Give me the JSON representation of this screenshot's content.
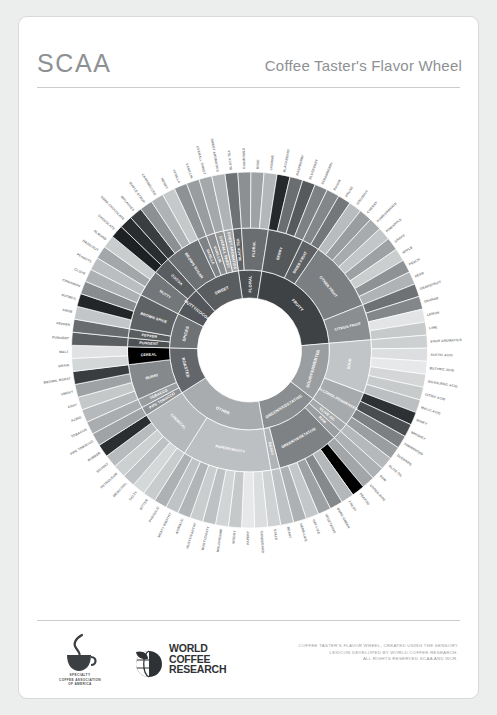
{
  "header": {
    "brand": "SCAA",
    "title": "Coffee Taster's Flavor Wheel"
  },
  "footer": {
    "scaa_logo_text": "SPECIALTY\nCOFFEE ASSOCIATION\nOF AMERICA",
    "wcr_logo_line1": "WORLD",
    "wcr_logo_line2": "COFFEE",
    "wcr_logo_line3": "RESEARCH",
    "credit_line1": "COFFEE TASTER'S FLAVOR WHEEL, CREATED USING THE SENSORY",
    "credit_line2": "LEXICON DEVELOPED BY WORLD COFFEE RESEARCH.",
    "credit_line3": "ALL RIGHTS RESERVED SCAA AND WCR."
  },
  "chart_data": {
    "type": "pie",
    "title": "Coffee Taster's Flavor Wheel",
    "subtitle": "",
    "xlabel": "",
    "ylabel": "",
    "legend_position": "none",
    "grid": false,
    "note": "Three-level sunburst. Angles are proportional to leaf counts; start angle measured clockwise from 12 o'clock.",
    "start_angle_deg": -8,
    "rings": [
      {
        "name": "inner",
        "r_inner": 52,
        "r_outer": 80
      },
      {
        "name": "middle",
        "r_inner": 80,
        "r_outer": 122
      },
      {
        "name": "outer",
        "r_inner": 122,
        "r_outer": 178
      }
    ],
    "categories": [
      {
        "label": "FLORAL",
        "color": "#4d5053",
        "text_color": "#ffffff",
        "groups": [
          {
            "label": "BLACK TEA",
            "color": "#5e6265",
            "text_color": "#ffffff",
            "leaves": [
              {
                "label": "BLACK TEA",
                "color": "#6e7275",
                "text_color": "#ffffff"
              }
            ]
          },
          {
            "label": "FLORAL",
            "color": "#6a6e71",
            "text_color": "#ffffff",
            "leaves": [
              {
                "label": "CHAMOMILE",
                "color": "#8d9093",
                "text_color": "#4a4d4f"
              },
              {
                "label": "ROSE",
                "color": "#9fa2a5",
                "text_color": "#4a4d4f"
              },
              {
                "label": "JASMINE",
                "color": "#b4b7b9",
                "text_color": "#4a4d4f"
              }
            ]
          }
        ]
      },
      {
        "label": "FRUITY",
        "color": "#3f4245",
        "text_color": "#ffffff",
        "groups": [
          {
            "label": "BERRY",
            "color": "#55585b",
            "text_color": "#ffffff",
            "leaves": [
              {
                "label": "BLACKBERRY",
                "color": "#26292b",
                "text_color": "#ffffff"
              },
              {
                "label": "RASPBERRY",
                "color": "#6b6e71",
                "text_color": "#ffffff"
              },
              {
                "label": "BLUEBERRY",
                "color": "#565a5d",
                "text_color": "#ffffff"
              },
              {
                "label": "STRAWBERRY",
                "color": "#7e8184",
                "text_color": "#ffffff"
              }
            ]
          },
          {
            "label": "DRIED FRUIT",
            "color": "#5e6164",
            "text_color": "#ffffff",
            "leaves": [
              {
                "label": "RAISIN",
                "color": "#84878a",
                "text_color": "#ffffff"
              },
              {
                "label": "PRUNE",
                "color": "#74777a",
                "text_color": "#ffffff"
              }
            ]
          },
          {
            "label": "OTHER FRUIT",
            "color": "#7c7f82",
            "text_color": "#ffffff",
            "leaves": [
              {
                "label": "COCONUT",
                "color": "#b9bcbe",
                "text_color": "#4a4d4f"
              },
              {
                "label": "CHERRY",
                "color": "#9a9da0",
                "text_color": "#ffffff"
              },
              {
                "label": "POMEGRANATE",
                "color": "#a8abad",
                "text_color": "#4a4d4f"
              },
              {
                "label": "PINEAPPLE",
                "color": "#c3c6c8",
                "text_color": "#4a4d4f"
              },
              {
                "label": "GRAPE",
                "color": "#9ea1a4",
                "text_color": "#4a4d4f"
              },
              {
                "label": "APPLE",
                "color": "#cbcecf",
                "text_color": "#4a4d4f"
              },
              {
                "label": "PEACH",
                "color": "#8f9295",
                "text_color": "#ffffff"
              },
              {
                "label": "PEAR",
                "color": "#b0b3b5",
                "text_color": "#4a4d4f"
              }
            ]
          },
          {
            "label": "CITRUS FRUIT",
            "color": "#8b8e91",
            "text_color": "#ffffff",
            "leaves": [
              {
                "label": "GRAPEFRUIT",
                "color": "#6f7275",
                "text_color": "#ffffff"
              },
              {
                "label": "ORANGE",
                "color": "#84878a",
                "text_color": "#ffffff"
              },
              {
                "label": "LEMON",
                "color": "#e2e4e5",
                "text_color": "#9a9d9f"
              },
              {
                "label": "LIME",
                "color": "#c7cacb",
                "text_color": "#6a6d6f"
              }
            ]
          }
        ]
      },
      {
        "label": "SOUR/FERMENTED",
        "color": "#9b9ea1",
        "text_color": "#ffffff",
        "groups": [
          {
            "label": "SOUR",
            "color": "#c2c5c7",
            "text_color": "#ffffff",
            "leaves": [
              {
                "label": "SOUR AROMATICS",
                "color": "#cdd0d1",
                "text_color": "#7a7d7f"
              },
              {
                "label": "ACETIC ACID",
                "color": "#dcdedf",
                "text_color": "#8a8d8f"
              },
              {
                "label": "BUTYRIC ACID",
                "color": "#e6e8e9",
                "text_color": "#9a9d9f"
              },
              {
                "label": "ISOVALERIC ACID",
                "color": "#d4d6d7",
                "text_color": "#8a8d8f"
              },
              {
                "label": "CITRIC ACID",
                "color": "#c8cbcc",
                "text_color": "#7a7d7f"
              },
              {
                "label": "MALIC ACID",
                "color": "#bcbfc1",
                "text_color": "#6a6d6f"
              }
            ]
          },
          {
            "label": "ALCOHOL/FERMENTED",
            "color": "#a7aaac",
            "text_color": "#ffffff",
            "leaves": [
              {
                "label": "WINEY",
                "color": "#2e3133",
                "text_color": "#ffffff"
              },
              {
                "label": "WHISKEY",
                "color": "#4a4d50",
                "text_color": "#ffffff"
              },
              {
                "label": "FERMENTED",
                "color": "#7d8083",
                "text_color": "#ffffff"
              },
              {
                "label": "OVERRIPE",
                "color": "#9b9ea0",
                "text_color": "#ffffff"
              }
            ]
          }
        ]
      },
      {
        "label": "GREEN/VEGETATIVE",
        "color": "#8b8e90",
        "text_color": "#ffffff",
        "groups": [
          {
            "label": "OLIVE OIL",
            "color": "#a6a9ab",
            "text_color": "#ffffff",
            "leaves": [
              {
                "label": "OLIVE OIL",
                "color": "#b6b9bb",
                "text_color": "#ffffff"
              }
            ]
          },
          {
            "label": "RAW",
            "color": "#9b9ea0",
            "text_color": "#ffffff",
            "leaves": [
              {
                "label": "RAW",
                "color": "#aeb1b3",
                "text_color": "#ffffff"
              }
            ]
          },
          {
            "label": "GREEN/VEGETATIVE",
            "color": "#7f8284",
            "text_color": "#ffffff",
            "leaves": [
              {
                "label": "UNDER-RIPE",
                "color": "#a3a6a8",
                "text_color": "#ffffff"
              },
              {
                "label": "PEAPOD",
                "color": "#9094 96",
                "text_color": "#ffffff"
              },
              {
                "label": "FRESH",
                "color": "#b5b8ba",
                "text_color": "#4a4d4f"
              },
              {
                "label": "DARK GREEN",
                "color": "#86898b",
                "text_color": "#ffffff"
              },
              {
                "label": "VEGETATIVE",
                "color": "#9ea1a3",
                "text_color": "#ffffff"
              },
              {
                "label": "HAY-LIKE",
                "color": "#c4c7c9",
                "text_color": "#4a4d4f"
              },
              {
                "label": "HERB-LIKE",
                "color": "#aeb1b3",
                "text_color": "#4a4d4f"
              }
            ]
          },
          {
            "label": "BEANY",
            "color": "#b1b4b6",
            "text_color": "#ffffff",
            "leaves": [
              {
                "label": "BEANY",
                "color": "#bfc2c4",
                "text_color": "#4a4d4f"
              }
            ]
          }
        ]
      },
      {
        "label": "OTHER",
        "color": "#a9acae",
        "text_color": "#ffffff",
        "groups": [
          {
            "label": "PAPERY/MUSTY",
            "color": "#bdc0c2",
            "text_color": "#ffffff",
            "leaves": [
              {
                "label": "STALE",
                "color": "#cfd2d3",
                "text_color": "#7a7d7f"
              },
              {
                "label": "CARDBOARD",
                "color": "#dbdddE",
                "text_color": "#8a8d8f"
              },
              {
                "label": "PAPERY",
                "color": "#e6e8e9",
                "text_color": "#9a9d9f"
              },
              {
                "label": "WOODY",
                "color": "#c6c9ca",
                "text_color": "#6a6d6f"
              },
              {
                "label": "MOLDY/DAMP",
                "color": "#d2d5d6",
                "text_color": "#7a7d7f"
              },
              {
                "label": "MUSTY/DUSTY",
                "color": "#bec1c3",
                "text_color": "#6a6d6f"
              },
              {
                "label": "MUSTY/EARTHY",
                "color": "#cacdce",
                "text_color": "#6a6d6f"
              },
              {
                "label": "ANIMALIC",
                "color": "#b2b5b7",
                "text_color": "#ffffff"
              },
              {
                "label": "MEATY BROTHY",
                "color": "#c0c3c5",
                "text_color": "#6a6d6f"
              },
              {
                "label": "PHENOLIC",
                "color": "#aeb1b3",
                "text_color": "#ffffff"
              }
            ]
          },
          {
            "label": "CHEMICAL",
            "color": "#b6b9bb",
            "text_color": "#ffffff",
            "leaves": [
              {
                "label": "BITTER",
                "color": "#c9cccd",
                "text_color": "#6a6d6f"
              },
              {
                "label": "SALTY",
                "color": "#d5d8d9",
                "text_color": "#7a7d7f"
              },
              {
                "label": "MEDICINAL",
                "color": "#bfc2c4",
                "text_color": "#6a6d6f"
              },
              {
                "label": "PETROLEUM",
                "color": "#cdd0d1",
                "text_color": "#6a6d6f"
              },
              {
                "label": "SKUNKY",
                "color": "#b8bbbd",
                "text_color": "#ffffff"
              },
              {
                "label": "RUBBER",
                "color": "#2b2e30",
                "text_color": "#ffffff"
              }
            ]
          }
        ]
      },
      {
        "label": "ROASTED",
        "color": "#63666a",
        "text_color": "#ffffff",
        "groups": [
          {
            "label": "PIPE TOBACCO",
            "color": "#8e9194",
            "text_color": "#ffffff",
            "leaves": [
              {
                "label": "PIPE TOBACCO",
                "color": "#a0a3a5",
                "text_color": "#ffffff"
              }
            ]
          },
          {
            "label": "TOBACCO",
            "color": "#9a9da0",
            "text_color": "#ffffff",
            "leaves": [
              {
                "label": "TOBACCO",
                "color": "#aaadaf",
                "text_color": "#ffffff"
              }
            ]
          },
          {
            "label": "BURNT",
            "color": "#86898c",
            "text_color": "#ffffff",
            "leaves": [
              {
                "label": "ACRID",
                "color": "#b6b9bb",
                "text_color": "#4a4d4f"
              },
              {
                "label": "ASHY",
                "color": "#c5c8c9",
                "text_color": "#4a4d4f"
              },
              {
                "label": "SMOKY",
                "color": "#9fa2a4",
                "text_color": "#ffffff"
              },
              {
                "label": "BROWN, ROAST",
                "color": "#3a3d3f",
                "text_color": "#ffffff"
              }
            ]
          },
          {
            "label": "CEREAL",
            "color": "#9396 98",
            "text_color": "#ffffff",
            "leaves": [
              {
                "label": "GRAIN",
                "color": "#d4d7d8",
                "text_color": "#7a7d7f"
              },
              {
                "label": "MALT",
                "color": "#e0e2e3",
                "text_color": "#8a8d8f"
              }
            ]
          }
        ]
      },
      {
        "label": "SPICES",
        "color": "#6f7275",
        "text_color": "#ffffff",
        "groups": [
          {
            "label": "PUNGENT",
            "color": "#4e5154",
            "text_color": "#ffffff",
            "leaves": [
              {
                "label": "PUNGENT",
                "color": "#5c5f62",
                "text_color": "#ffffff"
              }
            ]
          },
          {
            "label": "PEPPER",
            "color": "#5a5d60",
            "text_color": "#ffffff",
            "leaves": [
              {
                "label": "PEPPER",
                "color": "#696c6f",
                "text_color": "#ffffff"
              }
            ]
          },
          {
            "label": "BROWN SPICE",
            "color": "#5f6265",
            "text_color": "#ffffff",
            "leaves": [
              {
                "label": "ANISE",
                "color": "#c3c6c8",
                "text_color": "#4a4d4f"
              },
              {
                "label": "NUTMEG",
                "color": "#232628",
                "text_color": "#ffffff"
              },
              {
                "label": "CINNAMON",
                "color": "#898c8e",
                "text_color": "#ffffff"
              },
              {
                "label": "CLOVE",
                "color": "#aeb1b3",
                "text_color": "#4a4d4f"
              }
            ]
          }
        ]
      },
      {
        "label": "NUTTY/COCOA",
        "color": "#53565a",
        "text_color": "#ffffff",
        "groups": [
          {
            "label": "NUTTY",
            "color": "#74777a",
            "text_color": "#ffffff",
            "leaves": [
              {
                "label": "PEANUTS",
                "color": "#bbbec0",
                "text_color": "#4a4d4f"
              },
              {
                "label": "HAZELNUT",
                "color": "#a4a7a9",
                "text_color": "#ffffff"
              },
              {
                "label": "ALMOND",
                "color": "#cacdce",
                "text_color": "#4a4d4f"
              }
            ]
          },
          {
            "label": "COCOA",
            "color": "#5a5d60",
            "text_color": "#ffffff",
            "leaves": [
              {
                "label": "CHOCOLATE",
                "color": "#1e2123",
                "text_color": "#ffffff"
              },
              {
                "label": "DARK CHOCOLATE",
                "color": "#2a2d2f",
                "text_color": "#ffffff"
              }
            ]
          }
        ]
      },
      {
        "label": "SWEET",
        "color": "#5a5d60",
        "text_color": "#ffffff",
        "groups": [
          {
            "label": "BROWN SUGAR",
            "color": "#6e7174",
            "text_color": "#ffffff",
            "leaves": [
              {
                "label": "MOLASSES",
                "color": "#3b3e40",
                "text_color": "#ffffff"
              },
              {
                "label": "MAPLE SYRUP",
                "color": "#8d9092",
                "text_color": "#ffffff"
              },
              {
                "label": "CARAMELIZED",
                "color": "#b0b3b5",
                "text_color": "#4a4d4f"
              },
              {
                "label": "HONEY",
                "color": "#c6c9ca",
                "text_color": "#4a4d4f"
              }
            ]
          },
          {
            "label": "VANILLA",
            "color": "#7f8285",
            "text_color": "#ffffff",
            "leaves": [
              {
                "label": "VANILLA",
                "color": "#8f9294",
                "text_color": "#ffffff"
              }
            ]
          },
          {
            "label": "VANILLIN",
            "color": "#8a8d90",
            "text_color": "#ffffff",
            "leaves": [
              {
                "label": "VANILLIN",
                "color": "#9a9d9f",
                "text_color": "#ffffff"
              }
            ]
          },
          {
            "label": "OVERALL SWEET",
            "color": "#959799",
            "text_color": "#ffffff",
            "leaves": [
              {
                "label": "OVERALL SWEET",
                "color": "#a5a8aa",
                "text_color": "#ffffff"
              }
            ]
          },
          {
            "label": "SWEET AROMATICS",
            "color": "#a0a3a5",
            "text_color": "#ffffff",
            "leaves": [
              {
                "label": "SWEET AROMATICS",
                "color": "#b0b3b5",
                "text_color": "#4a4d4f"
              }
            ]
          }
        ]
      }
    ]
  }
}
